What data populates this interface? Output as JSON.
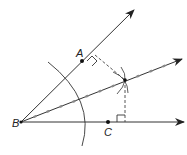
{
  "diagram": {
    "labels": {
      "A": "A",
      "B": "B",
      "C": "C"
    },
    "points": {
      "B": [
        21,
        122
      ],
      "A": [
        82,
        61
      ],
      "C": [
        108,
        122
      ],
      "P": [
        125,
        80
      ]
    },
    "rays": [
      {
        "name": "ray-BA",
        "from": [
          21,
          122
        ],
        "to": [
          134,
          10
        ]
      },
      {
        "name": "ray-bisector",
        "from": [
          21,
          122
        ],
        "to": [
          182,
          59
        ]
      },
      {
        "name": "ray-BC",
        "from": [
          21,
          122
        ],
        "to": [
          184,
          122
        ]
      }
    ],
    "colors": {
      "line": "#333333",
      "dash": "#444444",
      "tick": "#888888"
    }
  }
}
